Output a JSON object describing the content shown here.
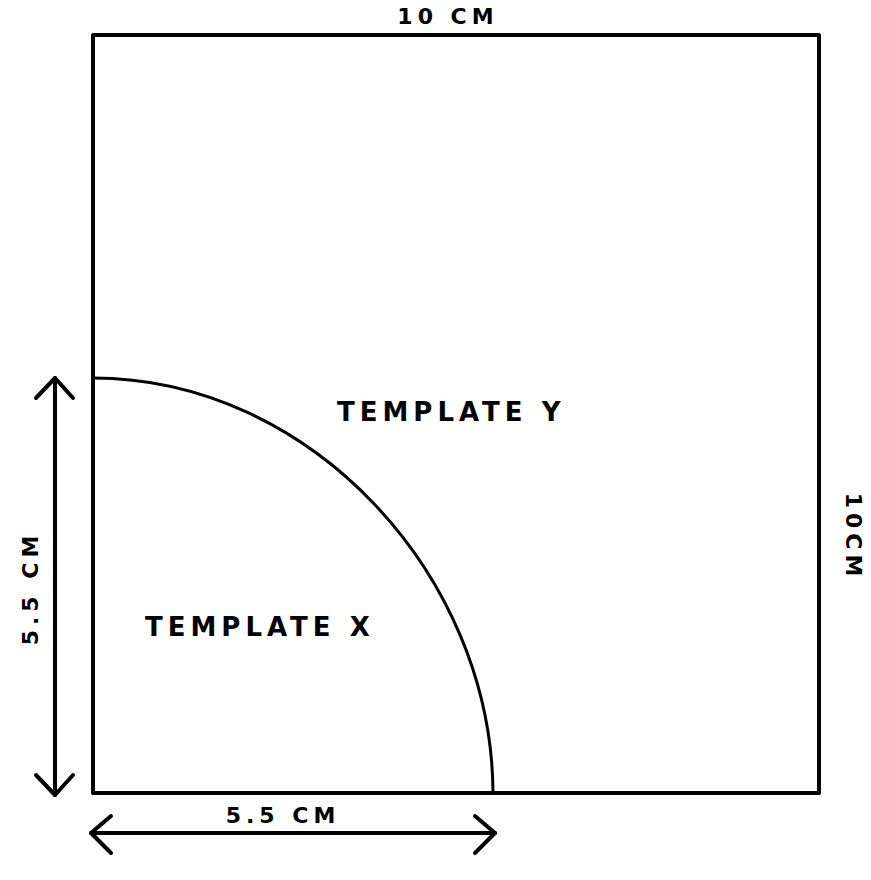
{
  "diagram": {
    "outer_square": {
      "top_label": "10 CM",
      "right_label": "10CM"
    },
    "quarter_circle": {
      "vertical_dimension_label": "5.5 CM",
      "horizontal_dimension_label": "5.5 CM"
    },
    "regions": {
      "inner_label": "TEMPLATE X",
      "outer_label": "TEMPLATE Y"
    },
    "colors": {
      "line": "#000000",
      "background": "#ffffff"
    }
  }
}
